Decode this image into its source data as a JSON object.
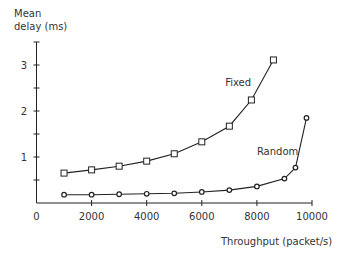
{
  "chart_data": {
    "type": "line",
    "title": "",
    "ylabel": "Mean\ndelay (ms)",
    "ylabel_lines": [
      "Mean",
      "delay (ms)"
    ],
    "xlabel": "Throughput (packet/s)",
    "xlim": [
      0,
      10000
    ],
    "ylim": [
      0,
      3.5
    ],
    "x_ticks": [
      0,
      2000,
      4000,
      6000,
      8000,
      10000
    ],
    "x_tick_labels": [
      "0",
      "2000",
      "4000",
      "6000",
      "8000",
      "10000"
    ],
    "y_ticks": [
      0,
      0.5,
      1,
      1.5,
      2,
      2.5,
      3,
      3.5
    ],
    "y_tick_labels": [
      "",
      "",
      "1",
      "",
      "2",
      "",
      "3",
      ""
    ],
    "grid": false,
    "legend": "inline labels",
    "series": [
      {
        "name": "Fixed",
        "marker": "square",
        "x": [
          1000,
          2000,
          3000,
          4000,
          5000,
          6000,
          7000,
          7800,
          8600
        ],
        "values": [
          0.65,
          0.72,
          0.8,
          0.91,
          1.07,
          1.33,
          1.67,
          2.24,
          3.11
        ],
        "label_pos": [
          6850,
          2.55
        ]
      },
      {
        "name": "Random",
        "marker": "circle",
        "x": [
          1000,
          2000,
          3000,
          4000,
          5000,
          6000,
          7000,
          8000,
          9000,
          9400,
          9800
        ],
        "values": [
          0.18,
          0.18,
          0.19,
          0.2,
          0.21,
          0.24,
          0.28,
          0.36,
          0.53,
          0.77,
          1.85
        ],
        "label_pos": [
          8000,
          1.05
        ]
      }
    ]
  }
}
